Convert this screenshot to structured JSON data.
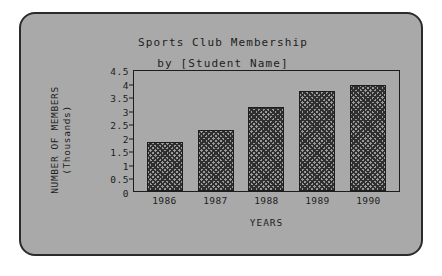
{
  "card": {
    "background_color": "#a9a9a9",
    "border_color": "#2b2b2b"
  },
  "chart_data": {
    "type": "bar",
    "title": "Sports Club Membership",
    "subtitle": "by [Student Name]",
    "xlabel": "YEARS",
    "ylabel_line1": "NUMBER OF MEMBERS",
    "ylabel_line2": "(Thousands)",
    "categories": [
      "1986",
      "1987",
      "1988",
      "1989",
      "1990"
    ],
    "values": [
      1.8,
      2.25,
      3.1,
      3.7,
      3.9
    ],
    "ylim": [
      0,
      4.5
    ],
    "ytick_labels": [
      "4.5",
      "4",
      "3.5",
      "3",
      "2.5",
      "2",
      "1.5",
      "1",
      "0.5",
      "0"
    ],
    "ytick_values": [
      4.5,
      4,
      3.5,
      3,
      2.5,
      2,
      1.5,
      1,
      0.5,
      0
    ],
    "grid": false,
    "legend": null,
    "bar_fill_color": "#9a9a9a",
    "bar_pattern": "crosshatch",
    "bar_border_color": "#1d1d1d"
  }
}
